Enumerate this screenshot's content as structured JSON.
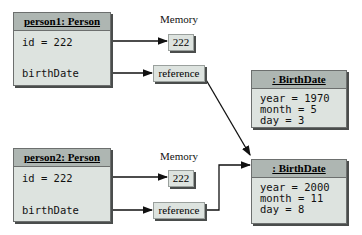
{
  "person1": {
    "title": "person1: Person",
    "id_label": "id = 222",
    "birth_label": "birthDate"
  },
  "person2": {
    "title": "person2: Person",
    "id_label": "id = 222",
    "birth_label": "birthDate"
  },
  "memory1": {
    "label": "Memory",
    "value": "222",
    "reference": "reference"
  },
  "memory2": {
    "label": "Memory",
    "value": "222",
    "reference": "reference"
  },
  "birthdate1": {
    "title": ": BirthDate",
    "lines": [
      "year = 1970",
      "month = 5",
      "day = 3"
    ]
  },
  "birthdate2": {
    "title": ": BirthDate",
    "lines": [
      "year = 2000",
      "month = 11",
      "day = 8"
    ]
  },
  "colors": {
    "box_fill": "#dde3df",
    "header_fill": "#aeb6b2",
    "border": "#6c6f6e"
  }
}
